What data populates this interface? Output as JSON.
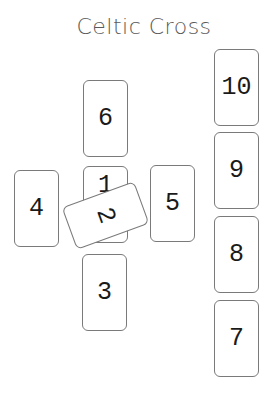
{
  "title": "Celtic Cross",
  "spread": {
    "name": "Celtic Cross",
    "card_count": 10,
    "cards": [
      {
        "position": 1,
        "label": "1",
        "orientation": "upright"
      },
      {
        "position": 2,
        "label": "2",
        "orientation": "crossing",
        "rotation_deg": -20
      },
      {
        "position": 3,
        "label": "3",
        "orientation": "upright"
      },
      {
        "position": 4,
        "label": "4",
        "orientation": "upright"
      },
      {
        "position": 5,
        "label": "5",
        "orientation": "upright"
      },
      {
        "position": 6,
        "label": "6",
        "orientation": "upright"
      },
      {
        "position": 7,
        "label": "7",
        "orientation": "upright"
      },
      {
        "position": 8,
        "label": "8",
        "orientation": "upright"
      },
      {
        "position": 9,
        "label": "9",
        "orientation": "upright"
      },
      {
        "position": 10,
        "label": "10",
        "orientation": "upright"
      }
    ]
  },
  "colors": {
    "card_border": "#7a7a7a",
    "card_fill": "#ffffff",
    "number_text": "#1a1a1a",
    "title_text": "#5a5a5a"
  }
}
